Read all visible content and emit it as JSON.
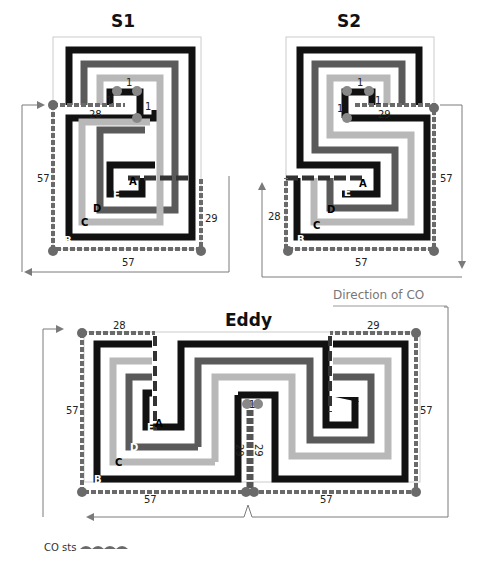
{
  "panels": {
    "s1": {
      "title": "S1",
      "dims": {
        "top": "28",
        "left": "57",
        "right": "29",
        "bottom": "57",
        "inner_top": "1",
        "inner_left": "1",
        "inner_right": "1"
      },
      "rows": [
        "A",
        "B",
        "C",
        "D",
        "E"
      ]
    },
    "s2": {
      "title": "S2",
      "dims": {
        "top": "29",
        "left": "28",
        "right": "57",
        "bottom": "57",
        "inner_top": "1",
        "inner_left": "1",
        "inner_right": "1"
      },
      "rows": [
        "A",
        "B",
        "C",
        "D",
        "E"
      ]
    },
    "eddy": {
      "title": "Eddy",
      "dims": {
        "top_left": "28",
        "top_right": "29",
        "left": "57",
        "right": "57",
        "bottom_left": "57",
        "bottom_right": "57",
        "center_top": "1",
        "center_left": "29",
        "center_right": "29"
      },
      "rows": [
        "A",
        "B",
        "C",
        "D",
        "E"
      ]
    }
  },
  "annotations": {
    "direction": "Direction of CO",
    "legend_label": "CO sts"
  },
  "colors": {
    "black": "#111111",
    "dark_grey": "#5a5a5a",
    "light_grey": "#b8b8b8",
    "co_sts": "#6a6a6a",
    "arrow": "#7a7a7a"
  }
}
